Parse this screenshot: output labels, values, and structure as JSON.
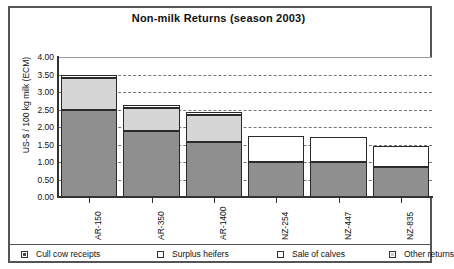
{
  "chart_data": {
    "type": "bar",
    "subtype": "stacked-vertical",
    "title": "Non-milk Returns (season 2003)",
    "xlabel": "",
    "ylabel": "US-$ / 100 kg milk (ECM)",
    "ylim": [
      0,
      4.0
    ],
    "ytick_step": 0.5,
    "ytick_labels": [
      "0.00",
      "0.50",
      "1.00",
      "1.50",
      "2.00",
      "2.50",
      "3.00",
      "3.50",
      "4.00"
    ],
    "ytick_values": [
      0,
      0.5,
      1.0,
      1.5,
      2.0,
      2.5,
      3.0,
      3.5,
      4.0
    ],
    "grid": "horizontal-dashed",
    "legend_position": "bottom",
    "categories": [
      "AR-150",
      "AR-350",
      "AR-1400",
      "NZ-254",
      "NZ-447",
      "NZ-835"
    ],
    "series": [
      {
        "name": "Cull cow receipts",
        "values": [
          2.5,
          1.9,
          1.58,
          1.0,
          1.0,
          0.85
        ]
      },
      {
        "name": "Surplus heifers",
        "values": [
          0.9,
          0.65,
          0.77,
          0.0,
          0.0,
          0.0
        ]
      },
      {
        "name": "Sale of calves",
        "values": [
          0.0,
          0.0,
          0.0,
          0.75,
          0.72,
          0.6
        ]
      },
      {
        "name": "Other returns",
        "values": [
          0.1,
          0.07,
          0.07,
          0.0,
          0.0,
          0.0
        ]
      }
    ],
    "totals": [
      3.5,
      2.62,
      2.42,
      1.75,
      1.72,
      1.45
    ],
    "colors": {
      "cull_cow_receipts": "#8f8f8f",
      "surplus_heifers": "#d6d6d6",
      "sale_of_calves": "#ffffff",
      "other_returns": "#fdfdfd",
      "axis": "#333333",
      "gridline": "#777777",
      "frame": "#555555"
    }
  },
  "legend": {
    "items": [
      {
        "label": "Cull cow receipts",
        "key": "cull"
      },
      {
        "label": "Surplus heifers",
        "key": "heifer"
      },
      {
        "label": "Sale of calves",
        "key": "calves"
      },
      {
        "label": "Other returns",
        "key": "other"
      }
    ]
  }
}
